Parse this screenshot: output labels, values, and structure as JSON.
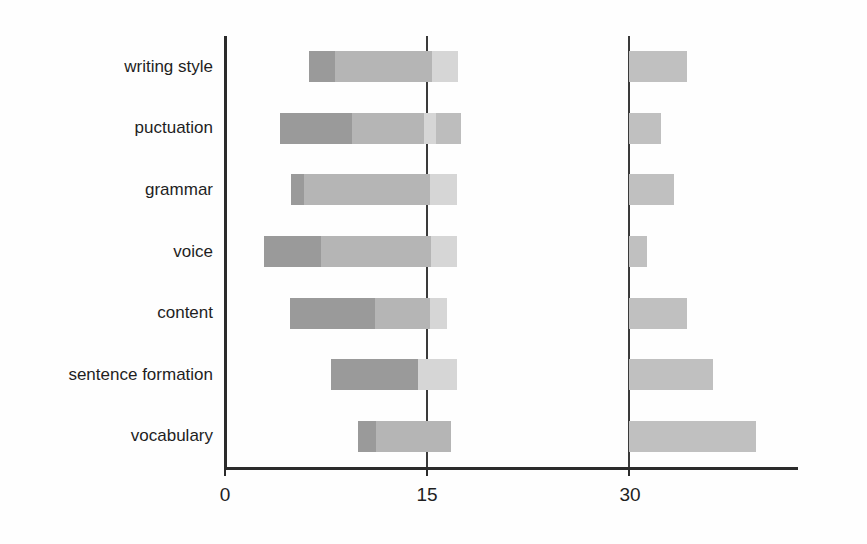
{
  "chart_data": {
    "type": "bar",
    "subtype": "stacked-horizontal",
    "title": "",
    "xlabel": "",
    "ylabel": "",
    "orientation": "horizontal",
    "stacked": true,
    "grid": true,
    "legend": "none",
    "xlim": [
      0,
      42
    ],
    "xticks": [
      0,
      15,
      30
    ],
    "xtick_labels": [
      "0",
      "15",
      "30"
    ],
    "categories": [
      "writing style",
      "puctuation",
      "grammar",
      "voice",
      "content",
      "sentence formation",
      "vocabulary"
    ],
    "series": [
      {
        "name": "segment-1-start",
        "note": "offset / leading blank before first visible segment",
        "values": [
          6.2,
          4.1,
          4.9,
          2.9,
          4.8,
          7.9,
          9.9
        ]
      },
      {
        "name": "segment-2-dark",
        "values": [
          2.0,
          5.3,
          1.0,
          4.2,
          6.3,
          6.4,
          1.3
        ]
      },
      {
        "name": "segment-3-mid",
        "values": [
          7.2,
          5.3,
          9.4,
          8.2,
          4.1,
          0.0,
          5.6
        ]
      },
      {
        "name": "segment-4-light",
        "values": [
          2.0,
          1.0,
          2.0,
          1.9,
          1.3,
          2.9,
          0.0
        ]
      },
      {
        "name": "segment-5-tail",
        "values": [
          0.0,
          1.8,
          0.0,
          0.0,
          0.0,
          0.0,
          0.0
        ]
      },
      {
        "name": "right-group",
        "note": "separate bars anchored at the 30 gridline",
        "start": 30.0,
        "values": [
          4.3,
          2.4,
          3.3,
          1.3,
          4.3,
          6.2,
          9.4
        ]
      }
    ],
    "bar_rows": [
      {
        "category": "writing style",
        "segments": [
          {
            "start": 6.2,
            "end": 8.2,
            "shade": "s1"
          },
          {
            "start": 8.2,
            "end": 15.4,
            "shade": "s2"
          },
          {
            "start": 15.4,
            "end": 17.3,
            "shade": "s3"
          }
        ],
        "right_bar": {
          "start": 30.0,
          "end": 34.3
        }
      },
      {
        "category": "puctuation",
        "segments": [
          {
            "start": 4.1,
            "end": 9.4,
            "shade": "s1"
          },
          {
            "start": 9.4,
            "end": 14.8,
            "shade": "s2"
          },
          {
            "start": 14.8,
            "end": 15.7,
            "shade": "s3"
          },
          {
            "start": 15.7,
            "end": 17.5,
            "shade": "s4"
          }
        ],
        "right_bar": {
          "start": 30.0,
          "end": 32.4
        }
      },
      {
        "category": "grammar",
        "segments": [
          {
            "start": 4.9,
            "end": 5.9,
            "shade": "s1"
          },
          {
            "start": 5.9,
            "end": 15.2,
            "shade": "s2"
          },
          {
            "start": 15.2,
            "end": 17.2,
            "shade": "s3"
          }
        ],
        "right_bar": {
          "start": 30.0,
          "end": 33.3
        }
      },
      {
        "category": "voice",
        "segments": [
          {
            "start": 2.9,
            "end": 7.1,
            "shade": "s1"
          },
          {
            "start": 7.1,
            "end": 15.3,
            "shade": "s2"
          },
          {
            "start": 15.3,
            "end": 17.2,
            "shade": "s3"
          }
        ],
        "right_bar": {
          "start": 30.0,
          "end": 31.3
        }
      },
      {
        "category": "content",
        "segments": [
          {
            "start": 4.8,
            "end": 11.1,
            "shade": "s1"
          },
          {
            "start": 11.1,
            "end": 15.2,
            "shade": "s2"
          },
          {
            "start": 15.2,
            "end": 16.5,
            "shade": "s3"
          }
        ],
        "right_bar": {
          "start": 30.0,
          "end": 34.3
        }
      },
      {
        "category": "sentence formation",
        "segments": [
          {
            "start": 7.9,
            "end": 14.3,
            "shade": "s1"
          },
          {
            "start": 14.3,
            "end": 17.2,
            "shade": "s3"
          }
        ],
        "right_bar": {
          "start": 30.0,
          "end": 36.2
        }
      },
      {
        "category": "vocabulary",
        "segments": [
          {
            "start": 9.9,
            "end": 11.2,
            "shade": "s1"
          },
          {
            "start": 11.2,
            "end": 16.8,
            "shade": "s2"
          }
        ],
        "right_bar": {
          "start": 30.0,
          "end": 39.4
        }
      }
    ],
    "colors": {
      "shade_dark": "#9a9a9a",
      "shade_mid": "#b5b5b5",
      "shade_light": "#d6d6d6",
      "shade_tail": "#bdbdbd",
      "right_bar": "#c0c0c0",
      "axis": "#2b2b2b",
      "gridline": "#3a3a3a",
      "text": "#1f1f1f",
      "background": "#fefefe"
    }
  },
  "axis": {
    "x_tick_0": "0",
    "x_tick_15": "15",
    "x_tick_30": "30"
  },
  "labels": {
    "cat0": "writing style",
    "cat1": "puctuation",
    "cat2": "grammar",
    "cat3": "voice",
    "cat4": "content",
    "cat5": "sentence formation",
    "cat6": "vocabulary"
  }
}
